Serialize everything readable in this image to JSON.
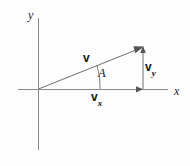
{
  "figure": {
    "background_color": "#fdfdfd",
    "width": 190,
    "height": 166
  },
  "axes": {
    "x_label": "x",
    "y_label": "y",
    "axis_color": "#8a8a8a",
    "origin": {
      "x": 38,
      "y": 89
    },
    "x_axis": {
      "x1": 18,
      "y1": 89,
      "x2": 168,
      "y2": 89
    },
    "y_axis": {
      "x1": 38,
      "y1": 18,
      "x2": 38,
      "y2": 150
    }
  },
  "vectors": {
    "resultant": {
      "label": "v",
      "from": {
        "x": 38,
        "y": 89
      },
      "to": {
        "x": 143,
        "y": 47
      },
      "color": "#6f6f6f"
    },
    "x_component": {
      "label_base": "v",
      "label_sub": "x",
      "from": {
        "x": 38,
        "y": 89
      },
      "to": {
        "x": 143,
        "y": 89
      },
      "color": "#6f6f6f"
    },
    "y_component": {
      "label_base": "v",
      "label_sub": "y",
      "from": {
        "x": 143,
        "y": 89
      },
      "to": {
        "x": 143,
        "y": 47
      },
      "color": "#6f6f6f"
    }
  },
  "angle": {
    "label": "A",
    "vertex": {
      "x": 38,
      "y": 89
    },
    "arc_radius": 62,
    "between": [
      "x-axis",
      "resultant-vector"
    ]
  }
}
